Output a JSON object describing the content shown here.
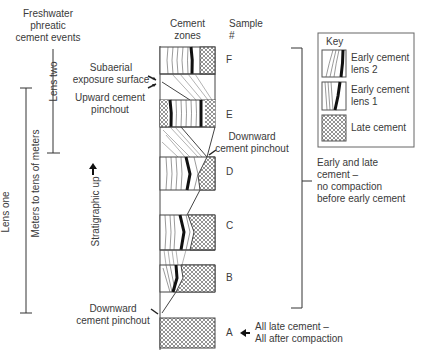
{
  "title_left": [
    "Freshwater",
    "phreatic",
    "cement events"
  ],
  "header": {
    "cement_zones": [
      "Cement",
      "zones"
    ],
    "sample": [
      "Sample",
      "#"
    ]
  },
  "lenses": {
    "lens_two": "Lens two",
    "lens_one": "Lens one",
    "scale": "Meters to tens of meters"
  },
  "stratigraphic": "Stratigraphic up",
  "annotations": {
    "subaerial": [
      "Subaerial",
      "exposure surface"
    ],
    "upward_pinchout": [
      "Upward cement",
      "pinchout"
    ],
    "downward_pinchout_mid": [
      "Downward",
      "cement pinchout"
    ],
    "downward_pinchout_low": [
      "Downward",
      "cement pinchout"
    ],
    "early_late": [
      "Early and late",
      "cement –",
      "no compaction",
      "before early cement"
    ],
    "all_late": [
      "All late cement –",
      "All after compaction"
    ]
  },
  "samples": [
    "F",
    "E",
    "D",
    "C",
    "B",
    "A"
  ],
  "key": {
    "title": "Key",
    "items": [
      {
        "label": [
          "Early cement",
          "lens 2"
        ],
        "pattern": "lines-thick-band"
      },
      {
        "label": [
          "Early cement",
          "lens 1"
        ],
        "pattern": "lines-curved-band"
      },
      {
        "label": [
          "Late cement"
        ],
        "pattern": "crosshatch"
      }
    ]
  },
  "colors": {
    "line": "#333333",
    "band": "#1a1a1a",
    "hatch": "#555555"
  }
}
